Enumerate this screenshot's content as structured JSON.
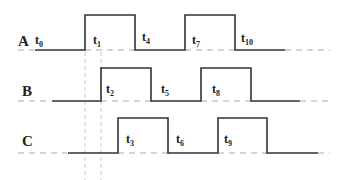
{
  "diagram": {
    "type": "timing-diagram",
    "signals": [
      {
        "name": "A",
        "labels": [
          {
            "base": "t",
            "sub": "0"
          },
          {
            "base": "t",
            "sub": "1"
          },
          {
            "base": "t",
            "sub": "4"
          },
          {
            "base": "t",
            "sub": "7"
          },
          {
            "base": "t",
            "sub": "10"
          }
        ]
      },
      {
        "name": "B",
        "labels": [
          {
            "base": "t",
            "sub": "2"
          },
          {
            "base": "t",
            "sub": "5"
          },
          {
            "base": "t",
            "sub": "8"
          }
        ]
      },
      {
        "name": "C",
        "labels": [
          {
            "base": "t",
            "sub": "3"
          },
          {
            "base": "t",
            "sub": "6"
          },
          {
            "base": "t",
            "sub": "9"
          }
        ]
      }
    ],
    "colors": {
      "signal": "#333333",
      "dashed_baseline": "#aaaaaa",
      "guide": "#bbbbbb"
    }
  }
}
